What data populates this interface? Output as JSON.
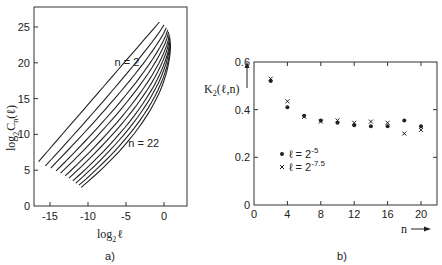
{
  "chart_data": [
    {
      "id": "a",
      "type": "line",
      "panel_label": "a)",
      "title": "",
      "xlabel": "log2 ℓ",
      "ylabel": "log2 Cn(ℓ)",
      "xlim": [
        -17,
        2.5
      ],
      "ylim": [
        0,
        28
      ],
      "xticks": [
        -15,
        -10,
        -5,
        0
      ],
      "yticks": [
        0,
        5,
        10,
        15,
        20,
        25
      ],
      "grid": false,
      "annotations": [
        {
          "text": "n = 2",
          "x": -6.5,
          "y": 19.5
        },
        {
          "text": "n = 22",
          "x": -4.7,
          "y": 8.2
        }
      ],
      "series_note": "11 curves for n = 2, 4, ..., 22; each rises from lower-left to upper-right and bends near log2 ℓ ≈ 0",
      "series": [
        {
          "name": "n=2",
          "start": [
            -16.5,
            6.2
          ],
          "end": [
            -0.6,
            25.7
          ]
        },
        {
          "name": "n=4",
          "start": [
            -15.6,
            5.6
          ],
          "end": [
            0.0,
            25.3
          ]
        },
        {
          "name": "n=6",
          "start": [
            -14.9,
            5.3
          ],
          "end": [
            0.3,
            24.9
          ]
        },
        {
          "name": "n=8",
          "start": [
            -14.2,
            4.9
          ],
          "end": [
            0.5,
            24.6
          ]
        },
        {
          "name": "n=10",
          "start": [
            -13.6,
            4.6
          ],
          "end": [
            0.6,
            24.3
          ]
        },
        {
          "name": "n=12",
          "start": [
            -13.0,
            4.2
          ],
          "end": [
            0.7,
            24.0
          ]
        },
        {
          "name": "n=14",
          "start": [
            -12.5,
            3.9
          ],
          "end": [
            0.75,
            23.7
          ]
        },
        {
          "name": "n=16",
          "start": [
            -12.0,
            3.5
          ],
          "end": [
            0.8,
            23.4
          ]
        },
        {
          "name": "n=18",
          "start": [
            -11.6,
            3.2
          ],
          "end": [
            0.8,
            23.1
          ]
        },
        {
          "name": "n=20",
          "start": [
            -11.2,
            2.9
          ],
          "end": [
            0.85,
            22.8
          ]
        },
        {
          "name": "n=22",
          "start": [
            -10.9,
            2.6
          ],
          "end": [
            0.85,
            22.5
          ]
        }
      ]
    },
    {
      "id": "b",
      "type": "scatter",
      "panel_label": "b)",
      "title": "",
      "xlabel": "n →",
      "ylabel": "K2(ℓ, n) ↑",
      "xlim": [
        0,
        22
      ],
      "ylim": [
        0,
        0.6
      ],
      "xticks": [
        0,
        4,
        8,
        12,
        16,
        20
      ],
      "yticks": [
        0,
        0.2,
        0.4,
        0.6
      ],
      "grid": false,
      "legend_position": "inside lower-left",
      "x": [
        2,
        4,
        6,
        8,
        10,
        12,
        14,
        16,
        18,
        20
      ],
      "series": [
        {
          "name": "ℓ = 2^-5",
          "marker": "dot",
          "values": [
            0.52,
            0.41,
            0.375,
            0.355,
            0.345,
            0.335,
            0.33,
            0.33,
            0.355,
            0.33
          ]
        },
        {
          "name": "ℓ = 2^-7.5",
          "marker": "cross",
          "values": [
            0.53,
            0.435,
            0.37,
            0.35,
            0.355,
            0.345,
            0.35,
            0.345,
            0.3,
            0.315
          ]
        }
      ]
    }
  ],
  "labels": {
    "a_ylabel_log": "log",
    "a_ylabel_sub": "2",
    "a_ylabel_main": "C",
    "a_ylabel_n": "n",
    "a_ylabel_arg": "(ℓ)",
    "a_xlabel_log": "log",
    "a_xlabel_sub": "2",
    "a_xlabel_var": "ℓ",
    "b_ylabel_main": "K",
    "b_ylabel_sub": "2",
    "b_ylabel_arg": "(ℓ,n)",
    "b_xlabel": "n",
    "legend_1_prefix": "ℓ = 2",
    "legend_1_exp": "-5",
    "legend_2_prefix": "ℓ = 2",
    "legend_2_exp": "-7.5"
  }
}
